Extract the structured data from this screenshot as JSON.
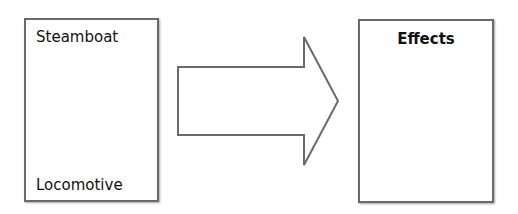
{
  "diagram": {
    "left_box": {
      "top_label": "Steamboat",
      "bottom_label": "Locomotive"
    },
    "arrow": {
      "direction": "right",
      "stroke": "#6a6a6a",
      "fill": "#ffffff"
    },
    "right_box": {
      "title": "Effects"
    },
    "colors": {
      "border": "#6a6a6a",
      "text": "#111111",
      "background": "#ffffff"
    }
  }
}
